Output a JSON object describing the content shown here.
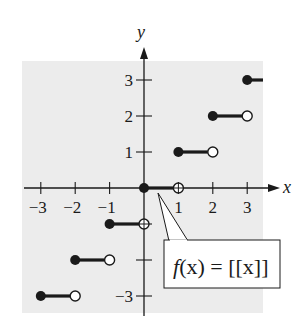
{
  "chart_data": {
    "type": "line",
    "title": "",
    "function_label": "f(x) = [[x]]",
    "xlabel": "x",
    "ylabel": "y",
    "xlim": [
      -3.4,
      3.5
    ],
    "ylim": [
      -3.4,
      3.4
    ],
    "x_ticks": [
      -3,
      -2,
      -1,
      1,
      2,
      3
    ],
    "x_tick_labels": [
      "−3",
      "−2",
      "−1",
      "1",
      "2",
      "3"
    ],
    "y_ticks": [
      3,
      2,
      1,
      -1,
      -2,
      -3
    ],
    "y_tick_labels_shown": [
      "3",
      "2",
      "1",
      "−3"
    ],
    "grid": false,
    "legend": "callout box pointing to segment at y=0",
    "series": [
      {
        "name": "greatest integer function",
        "segments": [
          {
            "x_start": -3,
            "x_end": -2,
            "y": -3,
            "start": "closed",
            "end": "open"
          },
          {
            "x_start": -2,
            "x_end": -1,
            "y": -2,
            "start": "closed",
            "end": "open"
          },
          {
            "x_start": -1,
            "x_end": 0,
            "y": -1,
            "start": "closed",
            "end": "open"
          },
          {
            "x_start": 0,
            "x_end": 1,
            "y": 0,
            "start": "closed",
            "end": "open"
          },
          {
            "x_start": 1,
            "x_end": 2,
            "y": 1,
            "start": "closed",
            "end": "open"
          },
          {
            "x_start": 2,
            "x_end": 3,
            "y": 2,
            "start": "closed",
            "end": "open"
          },
          {
            "x_start": 3,
            "x_end": 3.5,
            "y": 3,
            "start": "closed",
            "end": "continues"
          }
        ]
      }
    ]
  },
  "labels": {
    "x_axis": "x",
    "y_axis": "y",
    "callout_f": "f",
    "callout_rest": "(x) = [[x]]"
  },
  "colors": {
    "plot_background": "#ececec",
    "ink": "#1a1a1a",
    "open_dot_fill": "#ffffff",
    "callout_fill": "#ffffff"
  }
}
